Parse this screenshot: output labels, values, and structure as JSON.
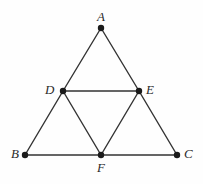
{
  "figure": {
    "width": 203,
    "height": 184,
    "background_color": "#fefefe",
    "stroke_color": "#333333",
    "point_color": "#1a1a1a",
    "label_color": "#2b2b2b",
    "stroke_width": 1.4,
    "point_radius": 3.2,
    "points": [
      {
        "id": "A",
        "label": "A",
        "x": 101,
        "y": 28,
        "label_x": 97,
        "label_y": 10
      },
      {
        "id": "D",
        "label": "D",
        "x": 63,
        "y": 91,
        "label_x": 45,
        "label_y": 83
      },
      {
        "id": "E",
        "label": "E",
        "x": 139,
        "y": 91,
        "label_x": 146,
        "label_y": 83
      },
      {
        "id": "B",
        "label": "B",
        "x": 25,
        "y": 155,
        "label_x": 11,
        "label_y": 147
      },
      {
        "id": "C",
        "label": "C",
        "x": 177,
        "y": 155,
        "label_x": 184,
        "label_y": 147
      },
      {
        "id": "F",
        "label": "F",
        "x": 101,
        "y": 155,
        "label_x": 97,
        "label_y": 161
      }
    ],
    "segments": [
      {
        "name": "segment-AD",
        "from": "A",
        "to": "D"
      },
      {
        "name": "segment-DB",
        "from": "D",
        "to": "B"
      },
      {
        "name": "segment-AE",
        "from": "A",
        "to": "E"
      },
      {
        "name": "segment-EC",
        "from": "E",
        "to": "C"
      },
      {
        "name": "segment-BF",
        "from": "B",
        "to": "F"
      },
      {
        "name": "segment-FC",
        "from": "F",
        "to": "C"
      },
      {
        "name": "segment-DE",
        "from": "D",
        "to": "E"
      },
      {
        "name": "segment-DF",
        "from": "D",
        "to": "F"
      },
      {
        "name": "segment-EF",
        "from": "E",
        "to": "F"
      }
    ]
  }
}
